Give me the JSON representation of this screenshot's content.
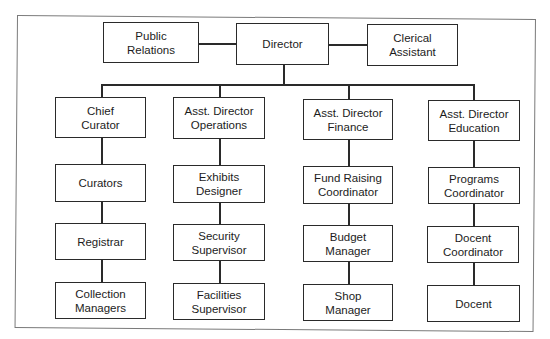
{
  "chart": {
    "type": "org-chart",
    "top_row": {
      "left": "Public\nRelations",
      "center": "Director",
      "right": "Clerical\nAssistant"
    },
    "columns": [
      {
        "head": "Chief\nCurator",
        "items": [
          "Curators",
          "Registrar",
          "Collection\nManagers"
        ]
      },
      {
        "head": "Asst. Director\nOperations",
        "items": [
          "Exhibits\nDesigner",
          "Security\nSupervisor",
          "Facilities\nSupervisor"
        ]
      },
      {
        "head": "Asst. Director\nFinance",
        "items": [
          "Fund Raising\nCoordinator",
          "Budget\nManager",
          "Shop\nManager"
        ]
      },
      {
        "head": "Asst. Director\nEducation",
        "items": [
          "Programs\nCoordinator",
          "Docent\nCoordinator",
          "Docent"
        ]
      }
    ]
  },
  "colors": {
    "line": "#2a2a2a",
    "text": "#1c1c1c",
    "frame": "#7a7a7a",
    "background": "#ffffff"
  }
}
